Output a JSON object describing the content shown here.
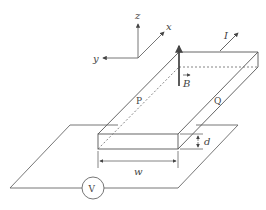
{
  "diagram": {
    "axes": {
      "z": "z",
      "x": "x",
      "y": "y"
    },
    "labels": {
      "current": "I",
      "field": "B",
      "point_p": "P",
      "point_q": "Q",
      "width": "w",
      "thickness": "d",
      "voltmeter": "V"
    },
    "colors": {
      "line": "#555555",
      "background": "#ffffff"
    }
  }
}
